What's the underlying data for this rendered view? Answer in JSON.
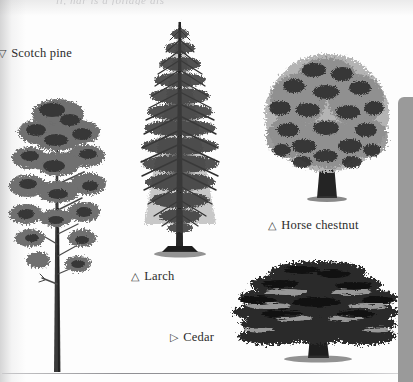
{
  "page": {
    "background_color": "#fdfdfd",
    "ink_color": "#2b2b2b",
    "clipped_headline": "ll, nar is a foliage dis",
    "bottom_rule": true
  },
  "side_panel": {
    "name": "scroll-panel",
    "color": "#9a9a9a"
  },
  "figures": [
    {
      "id": "scotch-pine",
      "common_name": "Scotch pine",
      "marker": "▽",
      "caption": "Scotch pine",
      "marker_clipped": true,
      "silhouette": "tall slender trunk with irregular open clumped crown in upper half"
    },
    {
      "id": "larch",
      "common_name": "Larch",
      "marker": "△",
      "caption": "Larch",
      "marker_clipped": false,
      "silhouette": "narrow conical conifer with straight leader and drooping horizontal branches"
    },
    {
      "id": "horse-chestnut",
      "common_name": "Horse chestnut",
      "marker": "△",
      "caption": "Horse chestnut",
      "marker_clipped": false,
      "silhouette": "broad dome-shaped dense crown on a short stout trunk"
    },
    {
      "id": "cedar",
      "common_name": "Cedar",
      "marker": "▷",
      "caption": "Cedar",
      "marker_clipped": false,
      "silhouette": "wide flat-topped crown with tiered horizontal layers of foliage"
    }
  ]
}
